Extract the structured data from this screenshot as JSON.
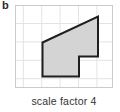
{
  "figure": {
    "label": "b",
    "caption": "scale factor 4",
    "grid": {
      "width": 98,
      "height": 83,
      "cell": 18.4,
      "first_line_x": 8.3,
      "first_line_y": 18.5,
      "line_color": "#e3e3e3",
      "box_border_color": "#cbcbcb",
      "box_fill": "#ffffff"
    },
    "shape": {
      "type": "polygon",
      "points_attr": "27.5,37.5 83,11.5 83,51.5 64,51.5 64,71.5 27.5,71.5",
      "fill": "#d4d4d4",
      "stroke": "#1f1f1f",
      "stroke_width": "2"
    }
  }
}
